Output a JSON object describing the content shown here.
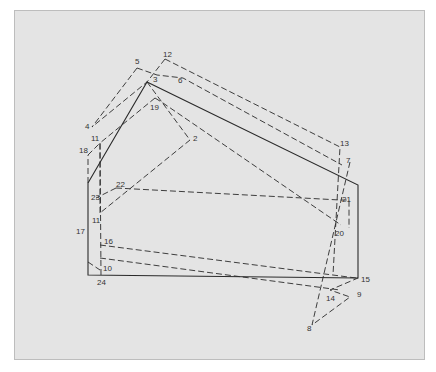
{
  "diagram": {
    "colors": {
      "background": "#e4e4e4",
      "border": "#bdbdbd",
      "stroke": "#2a2a2a",
      "label": "#333333"
    },
    "solid_polygon": [
      [
        88,
        183
      ],
      [
        147,
        82
      ],
      [
        358,
        185
      ],
      [
        358,
        278
      ],
      [
        88,
        275
      ]
    ],
    "dashed_paths": [
      [
        [
          88,
          183
        ],
        [
          88,
          155
        ]
      ],
      [
        [
          137,
          68
        ],
        [
          157,
          75
        ],
        [
          183,
          78
        ],
        [
          342,
          165
        ]
      ],
      [
        [
          165,
          59
        ],
        [
          340,
          147
        ],
        [
          333,
          275
        ]
      ],
      [
        [
          165,
          59
        ],
        [
          147,
          82
        ],
        [
          92,
          127
        ]
      ],
      [
        [
          137,
          68
        ],
        [
          92,
          127
        ]
      ],
      [
        [
          147,
          82
        ],
        [
          190,
          140
        ],
        [
          100,
          213
        ]
      ],
      [
        [
          155,
          98
        ],
        [
          100,
          143
        ],
        [
          100,
          213
        ]
      ],
      [
        [
          155,
          98
        ],
        [
          163,
          103
        ],
        [
          341,
          225
        ]
      ],
      [
        [
          350,
          162
        ],
        [
          312,
          325
        ],
        [
          350,
          297
        ],
        [
          330,
          290
        ],
        [
          358,
          278
        ]
      ],
      [
        [
          100,
          245
        ],
        [
          356,
          278
        ]
      ],
      [
        [
          100,
          258
        ],
        [
          340,
          290
        ]
      ],
      [
        [
          88,
          262
        ],
        [
          100,
          270
        ]
      ],
      [
        [
          116,
          188
        ],
        [
          340,
          200
        ],
        [
          349,
          200
        ],
        [
          349,
          228
        ]
      ],
      [
        [
          116,
          188
        ],
        [
          96,
          198
        ]
      ],
      [
        [
          88,
          155
        ],
        [
          100,
          143
        ]
      ],
      [
        [
          100,
          143
        ],
        [
          101,
          275
        ]
      ]
    ],
    "labels": [
      {
        "id": "2",
        "x": 193,
        "y": 141
      },
      {
        "id": "3",
        "x": 153,
        "y": 82
      },
      {
        "id": "4",
        "x": 85,
        "y": 129
      },
      {
        "id": "5",
        "x": 135,
        "y": 64
      },
      {
        "id": "6",
        "x": 178,
        "y": 83
      },
      {
        "id": "7",
        "x": 346,
        "y": 163
      },
      {
        "id": "8",
        "x": 307,
        "y": 331
      },
      {
        "id": "9",
        "x": 357,
        "y": 297
      },
      {
        "id": "10",
        "x": 103,
        "y": 271
      },
      {
        "id": "11",
        "x": 91,
        "y": 141
      },
      {
        "id": "11",
        "x": 92,
        "y": 223
      },
      {
        "id": "12",
        "x": 163,
        "y": 57
      },
      {
        "id": "13",
        "x": 340,
        "y": 146
      },
      {
        "id": "14",
        "x": 326,
        "y": 301
      },
      {
        "id": "15",
        "x": 361,
        "y": 282
      },
      {
        "id": "16",
        "x": 104,
        "y": 244
      },
      {
        "id": "17",
        "x": 76,
        "y": 234
      },
      {
        "id": "18",
        "x": 79,
        "y": 153
      },
      {
        "id": "19",
        "x": 150,
        "y": 110
      },
      {
        "id": "20",
        "x": 335,
        "y": 236
      },
      {
        "id": "21",
        "x": 342,
        "y": 202
      },
      {
        "id": "22",
        "x": 116,
        "y": 187
      },
      {
        "id": "23",
        "x": 91,
        "y": 200
      },
      {
        "id": "24",
        "x": 97,
        "y": 285
      }
    ]
  }
}
